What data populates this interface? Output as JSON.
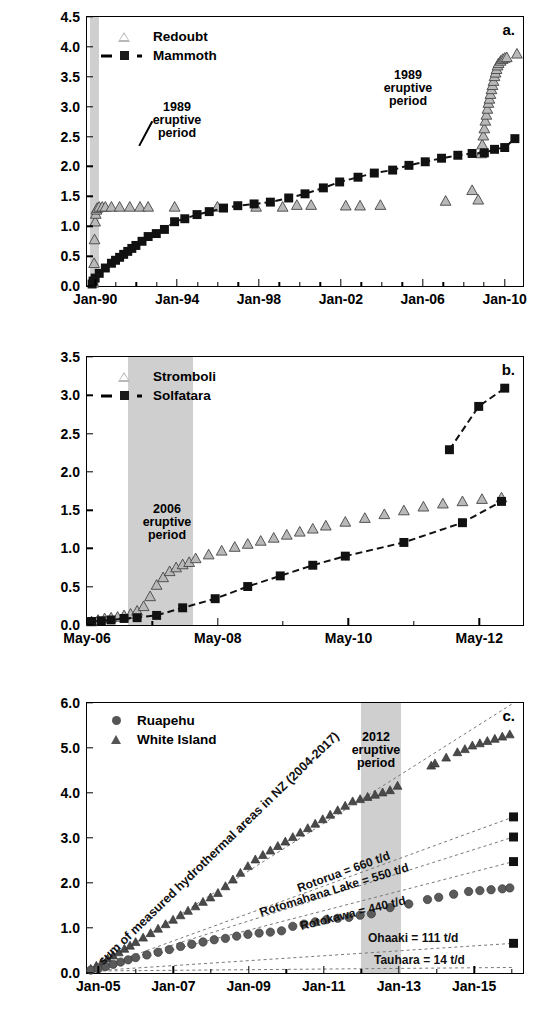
{
  "figure": {
    "axis_title": "Cumulative CO2 Emission (Mt)",
    "axis_title_main": "Cumulative CO",
    "axis_title_sub": "2",
    "axis_title_tail": " Emission (Mt)"
  },
  "panels": [
    {
      "id": "a",
      "letter": "a.",
      "ylabel": "Cumulative CO2 Emission (Mt)",
      "ylim": [
        0.0,
        4.5
      ],
      "yticks": [
        "0.0",
        "0.5",
        "1.0",
        "1.5",
        "2.0",
        "2.5",
        "3.0",
        "3.5",
        "4.0",
        "4.5"
      ],
      "xticks": [
        "Jan-90",
        "Jan-94",
        "Jan-98",
        "Jan-02",
        "Jan-06",
        "Jan-10"
      ],
      "xlim_years": [
        1989.6,
        2010.9
      ],
      "xtick_years": [
        1990.0,
        1994.0,
        1998.0,
        2002.0,
        2006.0,
        2010.0
      ],
      "minor_tick_years": [
        1991,
        1992,
        1993,
        1995,
        1996,
        1997,
        1999,
        2000,
        2001,
        2003,
        2004,
        2005,
        2007,
        2008,
        2009
      ],
      "legend": [
        {
          "label": "Redoubt",
          "marker": "triangle-open",
          "line": false
        },
        {
          "label": "Mammoth",
          "marker": "square-filled",
          "line": true
        }
      ],
      "annotations": [
        {
          "text_lines": [
            "1989",
            "eruptive",
            "period"
          ],
          "leader": true
        }
      ],
      "shaded_regions": [
        {
          "label": "1989 eruptive period",
          "x_start_year": 1989.75,
          "x_end_year": 1990.2
        }
      ]
    },
    {
      "id": "b",
      "letter": "b.",
      "ylabel": "Cumulative CO2 Emission (Mt)",
      "ylim": [
        0.0,
        3.5
      ],
      "yticks": [
        "0.0",
        "0.5",
        "1.0",
        "1.5",
        "2.0",
        "2.5",
        "3.0",
        "3.5"
      ],
      "xticks": [
        "May-06",
        "May-08",
        "May-10",
        "May-12"
      ],
      "xlim_years": [
        2006.33,
        2013.0
      ],
      "xtick_years": [
        2006.33,
        2008.33,
        2010.33,
        2012.33
      ],
      "minor_tick_years": [
        2007.33,
        2009.33,
        2011.33
      ],
      "legend": [
        {
          "label": "Stromboli",
          "marker": "triangle-open",
          "line": false
        },
        {
          "label": "Solfatara",
          "marker": "square-filled",
          "line": true
        }
      ],
      "annotations": [
        {
          "text_lines": [
            "2006",
            "eruptive",
            "period"
          ],
          "leader": false
        }
      ],
      "shaded_regions": [
        {
          "label": "2006 eruptive period",
          "x_start_year": 2006.95,
          "x_end_year": 2007.95
        }
      ]
    },
    {
      "id": "c",
      "letter": "c.",
      "ylabel": "Cumulative CO2 Emission (Mt)",
      "ylim": [
        0.0,
        6.0
      ],
      "yticks": [
        "0.0",
        "1.0",
        "2.0",
        "3.0",
        "4.0",
        "5.0",
        "6.0"
      ],
      "xticks": [
        "Jan-05",
        "Jan-07",
        "Jan-09",
        "Jan-11",
        "Jan-13",
        "Jan-15"
      ],
      "xlim_years": [
        2004.7,
        2016.3
      ],
      "xtick_years": [
        2005.0,
        2007.0,
        2009.0,
        2011.0,
        2013.0,
        2015.0
      ],
      "minor_tick_years": [
        2006,
        2008,
        2010,
        2012,
        2014,
        2016
      ],
      "legend": [
        {
          "label": "Ruapehu",
          "marker": "circle-filled",
          "line": false
        },
        {
          "label": "White Island",
          "marker": "triangle-filled",
          "line": false
        }
      ],
      "annotations": [
        {
          "text_lines": [
            "2012",
            "eruptive",
            "period"
          ],
          "leader": false
        }
      ],
      "shaded_regions": [
        {
          "label": "2012 eruptive period",
          "x_start_year": 2012.0,
          "x_end_year": 2013.05
        }
      ],
      "reference_lines": [
        {
          "label": "sum of measured hydrothermal areas in NZ (2004-2017)",
          "end_value": 6.0,
          "rate_label": ""
        },
        {
          "label": "Rotorua = 660 t/d",
          "end_value": 3.45,
          "rate_t_per_day": 660
        },
        {
          "label": "Rotomahana Lake = 550 t/d",
          "end_value": 3.0,
          "rate_t_per_day": 550
        },
        {
          "label": "Rotokawa = 440 t/d",
          "end_value": 2.45,
          "rate_t_per_day": 440
        },
        {
          "label": "Ohaaki = 111 t/d",
          "end_value": 0.62,
          "rate_t_per_day": 111
        },
        {
          "label": "Tauhara = 14 t/d",
          "end_value": 0.08,
          "rate_t_per_day": 14
        }
      ]
    }
  ],
  "chart_data": [
    {
      "type": "line",
      "panel": "a",
      "title": "",
      "xlabel": "",
      "ylabel": "Cumulative CO2 Emission (Mt)",
      "ylim": [
        0.0,
        4.5
      ],
      "xlim": [
        "Jan-90",
        "Jan-10"
      ],
      "grid": false,
      "legend_position": "top-left",
      "series": [
        {
          "name": "Redoubt",
          "marker": "triangle-open",
          "x": [
            1989.92,
            1989.95,
            1989.97,
            1990.0,
            1990.03,
            1990.06,
            1990.1,
            1990.2,
            1990.35,
            1990.5,
            1990.8,
            1991.2,
            1991.7,
            1992.2,
            1992.6,
            1993.9,
            1996.0,
            1997.9,
            1999.2,
            1999.9,
            2000.6,
            2002.3,
            2003.0,
            2004.0,
            2007.2,
            2008.5,
            2008.8,
            2008.95,
            2009.0,
            2009.05,
            2009.1,
            2009.15,
            2009.2,
            2009.25,
            2009.3,
            2009.35,
            2009.4,
            2009.45,
            2009.5,
            2009.55,
            2009.6,
            2009.65,
            2009.7,
            2009.75,
            2009.8,
            2009.9,
            2010.0,
            2010.1,
            2010.2,
            2010.7
          ],
          "y": [
            0.02,
            0.35,
            0.75,
            1.05,
            1.18,
            1.25,
            1.28,
            1.3,
            1.3,
            1.3,
            1.3,
            1.3,
            1.3,
            1.3,
            1.3,
            1.3,
            1.3,
            1.3,
            1.3,
            1.33,
            1.33,
            1.32,
            1.32,
            1.33,
            1.4,
            1.58,
            1.42,
            2.2,
            2.35,
            2.5,
            2.62,
            2.75,
            2.85,
            2.95,
            3.05,
            3.12,
            3.2,
            3.28,
            3.35,
            3.42,
            3.5,
            3.56,
            3.62,
            3.68,
            3.72,
            3.76,
            3.79,
            3.81,
            3.82,
            3.88
          ]
        },
        {
          "name": "Mammoth",
          "marker": "square-filled",
          "x": [
            1989.85,
            1989.9,
            1990.0,
            1990.2,
            1990.5,
            1990.8,
            1991.0,
            1991.2,
            1991.4,
            1991.6,
            1991.8,
            1992.0,
            1992.3,
            1992.6,
            1993.0,
            1993.4,
            1993.9,
            1994.4,
            1995.0,
            1995.6,
            1996.3,
            1997.0,
            1997.8,
            1998.6,
            1999.5,
            2000.3,
            2001.2,
            2002.0,
            2002.9,
            2003.7,
            2004.6,
            2005.4,
            2006.2,
            2007.0,
            2007.8,
            2008.5,
            2009.1,
            2009.6,
            2010.1,
            2010.6
          ],
          "y": [
            0.0,
            0.05,
            0.1,
            0.18,
            0.27,
            0.35,
            0.4,
            0.45,
            0.5,
            0.55,
            0.6,
            0.65,
            0.72,
            0.8,
            0.85,
            0.92,
            1.05,
            1.1,
            1.17,
            1.22,
            1.28,
            1.32,
            1.35,
            1.38,
            1.45,
            1.52,
            1.62,
            1.72,
            1.8,
            1.87,
            1.92,
            2.0,
            2.06,
            2.12,
            2.17,
            2.2,
            2.21,
            2.27,
            2.3,
            2.45
          ]
        }
      ]
    },
    {
      "type": "line",
      "panel": "b",
      "title": "",
      "xlabel": "",
      "ylabel": "Cumulative CO2 Emission (Mt)",
      "ylim": [
        0.0,
        3.5
      ],
      "xlim": [
        "May-06",
        "May-12"
      ],
      "grid": false,
      "legend_position": "top-left",
      "series": [
        {
          "name": "Stromboli",
          "marker": "triangle-open",
          "x": [
            2006.4,
            2006.5,
            2006.6,
            2006.7,
            2006.8,
            2006.9,
            2007.0,
            2007.1,
            2007.2,
            2007.3,
            2007.4,
            2007.5,
            2007.6,
            2007.7,
            2007.8,
            2007.9,
            2008.0,
            2008.2,
            2008.4,
            2008.6,
            2008.8,
            2009.0,
            2009.2,
            2009.4,
            2009.6,
            2009.8,
            2010.0,
            2010.3,
            2010.6,
            2010.9,
            2011.2,
            2011.5,
            2011.8,
            2012.1,
            2012.4,
            2012.7
          ],
          "y": [
            0.02,
            0.04,
            0.06,
            0.07,
            0.08,
            0.1,
            0.12,
            0.16,
            0.22,
            0.35,
            0.5,
            0.6,
            0.68,
            0.73,
            0.77,
            0.8,
            0.85,
            0.9,
            0.95,
            1.0,
            1.04,
            1.08,
            1.12,
            1.16,
            1.2,
            1.24,
            1.28,
            1.33,
            1.38,
            1.43,
            1.48,
            1.53,
            1.57,
            1.6,
            1.63,
            1.65
          ]
        },
        {
          "name": "Solfatara",
          "marker": "square-filled",
          "x": [
            2006.4,
            2006.55,
            2006.7,
            2006.9,
            2007.1,
            2007.4,
            2007.8,
            2008.3,
            2008.8,
            2009.3,
            2009.8,
            2010.3,
            2011.2,
            2012.1,
            2012.7
          ],
          "y": [
            0.02,
            0.03,
            0.04,
            0.06,
            0.07,
            0.1,
            0.2,
            0.32,
            0.48,
            0.62,
            0.76,
            0.88,
            1.06,
            1.32,
            1.6
          ]
        },
        {
          "name": "Solfatara (extension)",
          "marker": "square-filled",
          "x": [
            2011.9,
            2012.35,
            2012.75
          ],
          "y": [
            2.28,
            2.85,
            3.09
          ]
        }
      ]
    },
    {
      "type": "line",
      "panel": "c",
      "title": "",
      "xlabel": "",
      "ylabel": "Cumulative CO2 Emission (Mt)",
      "ylim": [
        0.0,
        6.0
      ],
      "xlim": [
        "Jan-05",
        "Jan-15"
      ],
      "grid": false,
      "legend_position": "top-left",
      "series": [
        {
          "name": "White Island",
          "marker": "triangle-filled",
          "x": [
            2004.8,
            2004.95,
            2005.1,
            2005.25,
            2005.4,
            2005.55,
            2005.7,
            2005.85,
            2006.0,
            2006.2,
            2006.4,
            2006.6,
            2006.8,
            2007.0,
            2007.2,
            2007.4,
            2007.6,
            2007.8,
            2008.0,
            2008.2,
            2008.4,
            2008.6,
            2008.8,
            2009.0,
            2009.2,
            2009.4,
            2009.6,
            2009.8,
            2010.0,
            2010.2,
            2010.4,
            2010.6,
            2010.8,
            2011.0,
            2011.2,
            2011.4,
            2011.6,
            2011.8,
            2012.0,
            2012.2,
            2012.4,
            2012.6,
            2012.8,
            2013.0,
            2013.9,
            2014.0,
            2014.3,
            2014.6,
            2014.8,
            2015.0,
            2015.2,
            2015.4,
            2015.6,
            2015.8,
            2016.0
          ],
          "y": [
            0.05,
            0.12,
            0.2,
            0.28,
            0.35,
            0.42,
            0.5,
            0.57,
            0.65,
            0.75,
            0.85,
            0.95,
            1.05,
            1.15,
            1.25,
            1.35,
            1.45,
            1.55,
            1.65,
            1.75,
            1.9,
            2.05,
            2.2,
            2.35,
            2.5,
            2.6,
            2.7,
            2.8,
            2.9,
            3.0,
            3.1,
            3.2,
            3.3,
            3.4,
            3.5,
            3.6,
            3.7,
            3.8,
            3.85,
            3.9,
            3.95,
            4.0,
            4.05,
            4.15,
            4.6,
            4.65,
            4.78,
            4.9,
            4.97,
            5.05,
            5.1,
            5.15,
            5.2,
            5.25,
            5.3
          ]
        },
        {
          "name": "Ruapehu",
          "marker": "circle-filled",
          "x": [
            2004.8,
            2005.0,
            2005.2,
            2005.4,
            2005.6,
            2005.8,
            2006.0,
            2006.3,
            2006.6,
            2006.9,
            2007.2,
            2007.5,
            2007.8,
            2008.1,
            2008.4,
            2008.7,
            2009.0,
            2009.3,
            2009.6,
            2009.9,
            2010.2,
            2010.5,
            2010.8,
            2011.1,
            2011.4,
            2011.7,
            2012.0,
            2012.3,
            2012.8,
            2013.3,
            2013.8,
            2014.1,
            2014.5,
            2014.9,
            2015.2,
            2015.5,
            2015.8,
            2016.0
          ],
          "y": [
            0.02,
            0.05,
            0.1,
            0.15,
            0.2,
            0.25,
            0.3,
            0.36,
            0.42,
            0.48,
            0.55,
            0.6,
            0.65,
            0.7,
            0.73,
            0.78,
            0.82,
            0.85,
            0.87,
            0.9,
            1.0,
            1.05,
            1.1,
            1.15,
            1.18,
            1.2,
            1.25,
            1.28,
            1.42,
            1.5,
            1.6,
            1.65,
            1.72,
            1.78,
            1.8,
            1.82,
            1.84,
            1.86
          ]
        }
      ],
      "reference_lines": [
        {
          "name": "sum of measured hydrothermal areas in NZ (2004-2017)",
          "end_y": 6.0
        },
        {
          "name": "Rotorua = 660 t/d",
          "end_y": 3.45
        },
        {
          "name": "Rotomahana Lake = 550 t/d",
          "end_y": 3.0
        },
        {
          "name": "Rotokawa = 440 t/d",
          "end_y": 2.45
        },
        {
          "name": "Ohaaki = 111 t/d",
          "end_y": 0.62
        },
        {
          "name": "Tauhara = 14 t/d",
          "end_y": 0.08
        }
      ]
    }
  ]
}
